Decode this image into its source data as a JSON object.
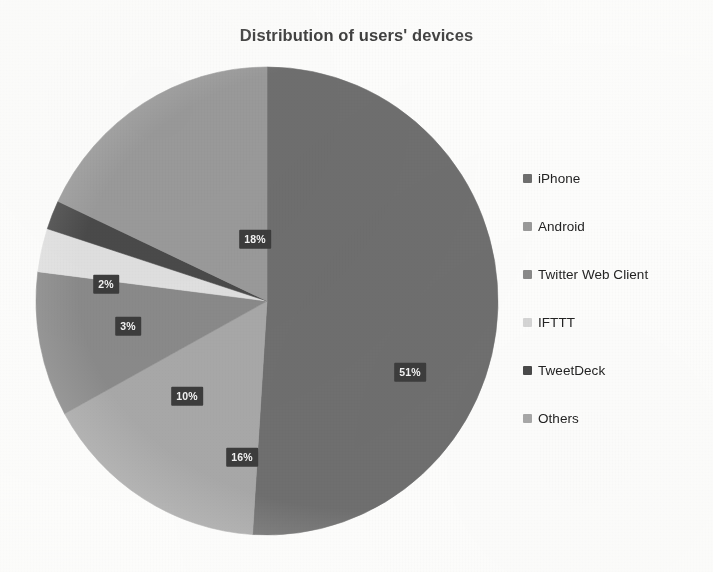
{
  "chart_data": {
    "type": "pie",
    "title": "Distribution of users' devices",
    "xlabel": "",
    "ylabel": "",
    "legend_position": "right",
    "grid": false,
    "start_angle_deg": 0,
    "direction": "clockwise",
    "categories": [
      "iPhone",
      "Android",
      "Twitter Web Client",
      "IFTTT",
      "TweetDeck",
      "Others"
    ],
    "values": [
      51,
      18,
      10,
      3,
      2,
      16
    ],
    "value_unit": "%",
    "data_labels": [
      "51%",
      "18%",
      "10%",
      "3%",
      "2%",
      "16%"
    ],
    "colors": [
      "#6f6f6f",
      "#9a9a9a",
      "#8a8a8a",
      "#e0e0e0",
      "#4a4a4a",
      "#a8a8a8"
    ],
    "slices": [
      {
        "label": "iPhone",
        "value": 51,
        "data_label": "51%",
        "color": "#6f6f6f",
        "label_x": 382,
        "label_y": 314
      },
      {
        "label": "Others",
        "value": 16,
        "data_label": "16%",
        "color": "#a8a8a8",
        "label_x": 214,
        "label_y": 399
      },
      {
        "label": "Twitter Web Client",
        "value": 10,
        "data_label": "10%",
        "color": "#8a8a8a",
        "label_x": 159,
        "label_y": 338
      },
      {
        "label": "IFTTT",
        "value": 3,
        "data_label": "3%",
        "color": "#e0e0e0",
        "label_x": 100,
        "label_y": 268
      },
      {
        "label": "TweetDeck",
        "value": 2,
        "data_label": "2%",
        "color": "#4a4a4a",
        "label_x": 78,
        "label_y": 226
      },
      {
        "label": "Android",
        "value": 18,
        "data_label": "18%",
        "color": "#9a9a9a",
        "label_x": 227,
        "label_y": 181
      }
    ]
  },
  "title": {
    "text": "Distribution of users' devices"
  },
  "legend": {
    "items": [
      {
        "label": "iPhone",
        "color": "#6f6f6f"
      },
      {
        "label": "Android",
        "color": "#9a9a9a"
      },
      {
        "label": "Twitter Web Client",
        "color": "#8a8a8a"
      },
      {
        "label": "IFTTT",
        "color": "#d5d5d5"
      },
      {
        "label": "TweetDeck",
        "color": "#4a4a4a"
      },
      {
        "label": "Others",
        "color": "#a8a8a8"
      }
    ]
  },
  "geometry": {
    "center_x": 239,
    "center_y": 243,
    "radius_x": 231,
    "radius_y": 234
  }
}
